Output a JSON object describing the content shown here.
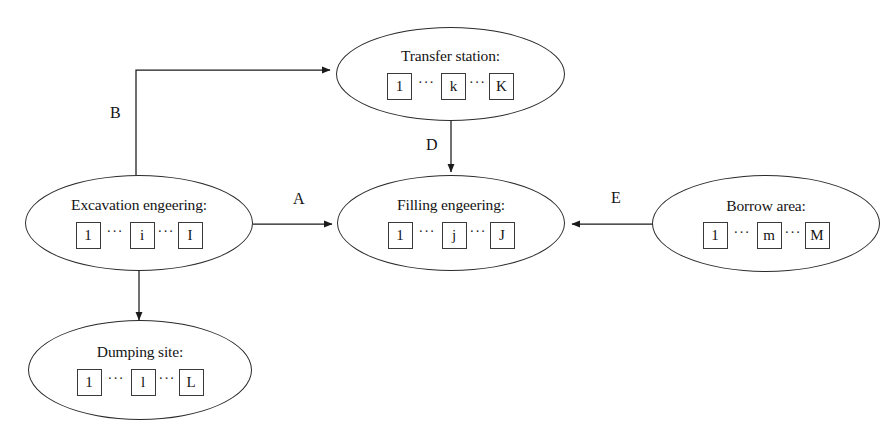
{
  "diagram": {
    "background_color": "#ffffff",
    "stroke_color": "#2b2b2b",
    "nodes": [
      {
        "id": "transfer-station",
        "title": "Transfer station:",
        "indices": [
          "1",
          "···",
          "k",
          "···",
          "K"
        ]
      },
      {
        "id": "excavation-engeering",
        "title": "Excavation engeering:",
        "indices": [
          "1",
          "···",
          "i",
          "···",
          "I"
        ]
      },
      {
        "id": "filling-engeering",
        "title": "Filling engeering:",
        "indices": [
          "1",
          "···",
          "j",
          "···",
          "J"
        ]
      },
      {
        "id": "borrow-area",
        "title": "Borrow area:",
        "indices": [
          "1",
          "···",
          "m",
          "···",
          "M"
        ]
      },
      {
        "id": "dumping-site",
        "title": "Dumping site:",
        "indices": [
          "1",
          "···",
          "l",
          "···",
          "L"
        ]
      }
    ],
    "edges": [
      {
        "id": "excavation-to-transfer",
        "label": "B",
        "from": "excavation-engeering",
        "to": "transfer-station"
      },
      {
        "id": "excavation-to-filling",
        "label": "A",
        "from": "excavation-engeering",
        "to": "filling-engeering"
      },
      {
        "id": "transfer-to-filling",
        "label": "D",
        "from": "transfer-station",
        "to": "filling-engeering"
      },
      {
        "id": "borrow-to-filling",
        "label": "E",
        "from": "borrow-area",
        "to": "filling-engeering"
      },
      {
        "id": "excavation-to-dumping",
        "label": "",
        "from": "excavation-engeering",
        "to": "dumping-site"
      }
    ]
  }
}
